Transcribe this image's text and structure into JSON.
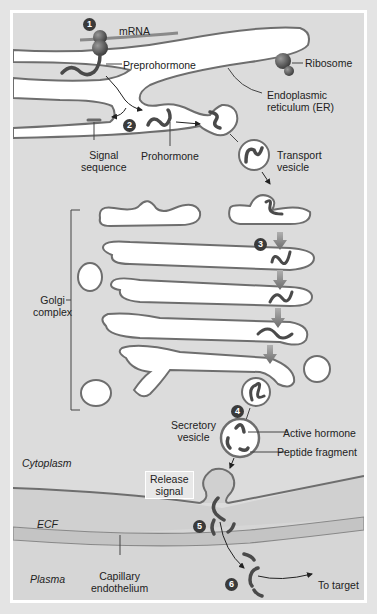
{
  "diagram": {
    "labels": {
      "mrna": "mRNA",
      "preprohormone": "Preprohormone",
      "ribosome": "Ribosome",
      "er": "Endoplasmic\nreticulum (ER)",
      "er_line1": "Endoplasmic",
      "er_line2": "reticulum (ER)",
      "signal_line1": "Signal",
      "signal_line2": "sequence",
      "prohormone": "Prohormone",
      "transport_line1": "Transport",
      "transport_line2": "vesicle",
      "golgi_line1": "Golgi",
      "golgi_line2": "complex",
      "secretory_line1": "Secretory",
      "secretory_line2": "vesicle",
      "active_hormone": "Active hormone",
      "peptide_fragment": "Peptide fragment",
      "cytoplasm": "Cytoplasm",
      "release_line1": "Release",
      "release_line2": "signal",
      "ecf": "ECF",
      "plasma": "Plasma",
      "capillary_line1": "Capillary",
      "capillary_line2": "endothelium",
      "to_target": "To target"
    },
    "steps": [
      "1",
      "2",
      "3",
      "4",
      "5",
      "6"
    ],
    "colors": {
      "background": "#dcdcdc",
      "frame": "#e4e4e4",
      "membrane": "#6e6e6e",
      "lumen": "#ffffff",
      "step_badge": "#3a3a3a",
      "peptide": "#4a4a4a",
      "capillary": "#c4c4c4",
      "ecf": "#d2d2d2"
    }
  }
}
